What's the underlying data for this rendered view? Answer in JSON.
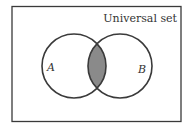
{
  "diagram": {
    "type": "venn",
    "universal_label": "Universal set",
    "sets": [
      {
        "label": "A",
        "cx": 74,
        "cy": 66,
        "r": 32
      },
      {
        "label": "B",
        "cx": 120,
        "cy": 66,
        "r": 32
      }
    ],
    "shaded_region": "A ∩ B",
    "colors": {
      "stroke": "#3a3a3a",
      "shade": "#8a8a8a",
      "background": "#ffffff"
    }
  }
}
